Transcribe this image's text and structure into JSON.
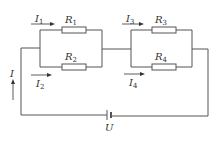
{
  "diagram": {
    "type": "circuit",
    "labels": {
      "I": "I",
      "I1": {
        "base": "I",
        "sub": "1"
      },
      "I2": {
        "base": "I",
        "sub": "2"
      },
      "I3": {
        "base": "I",
        "sub": "3"
      },
      "I4": {
        "base": "I",
        "sub": "4"
      },
      "R1": {
        "base": "R",
        "sub": "1"
      },
      "R2": {
        "base": "R",
        "sub": "2"
      },
      "R3": {
        "base": "R",
        "sub": "3"
      },
      "R4": {
        "base": "R",
        "sub": "4"
      },
      "U": "U"
    },
    "components": [
      {
        "id": "R1",
        "type": "resistor",
        "branch": "block1-top"
      },
      {
        "id": "R2",
        "type": "resistor",
        "branch": "block1-bottom"
      },
      {
        "id": "R3",
        "type": "resistor",
        "branch": "block2-top"
      },
      {
        "id": "R4",
        "type": "resistor",
        "branch": "block2-bottom"
      },
      {
        "id": "U",
        "type": "battery",
        "position": "bottom-center"
      }
    ],
    "currents": [
      {
        "id": "I",
        "direction": "up",
        "position": "left wire"
      },
      {
        "id": "I1",
        "direction": "right",
        "through": "R1"
      },
      {
        "id": "I2",
        "direction": "right",
        "through": "R2"
      },
      {
        "id": "I3",
        "direction": "right",
        "through": "R3"
      },
      {
        "id": "I4",
        "direction": "right",
        "through": "R4"
      }
    ]
  }
}
